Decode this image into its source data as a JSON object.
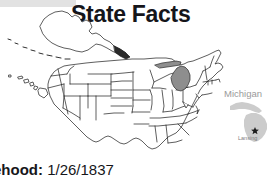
{
  "page": {
    "title": "State Facts",
    "background_color": "#ffffff"
  },
  "map": {
    "name": "united-states-outline-map",
    "highlighted_state": "Michigan",
    "highlight_color": "#8e8e8e",
    "outline_color": "#1a1a1a",
    "fill_color": "#ffffff",
    "includes_alaska": true,
    "includes_hawaii": true
  },
  "inset": {
    "state_label": "Michigan",
    "state_label_color": "#9a9a9a",
    "capital_label": "Lansing",
    "capital_label_color": "#7d7d7d",
    "capital_marker": "star",
    "shape_color": "#cfcfcf"
  },
  "facts": {
    "statehood_label": "tehood:",
    "statehood_value": "1/26/1837"
  }
}
